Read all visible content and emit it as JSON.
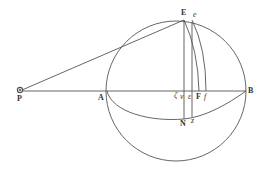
{
  "figure": {
    "type": "geometric-diagram",
    "stroke_color": "#555555",
    "background": "#ffffff",
    "circle": {
      "cx": 176,
      "cy": 91,
      "r": 70
    },
    "points": {
      "P": {
        "x": 20,
        "y": 91,
        "symbol": "sun"
      },
      "A": {
        "x": 107,
        "y": 91
      },
      "B": {
        "x": 246,
        "y": 91
      },
      "E": {
        "x": 184,
        "y": 20
      },
      "e": {
        "x": 192,
        "y": 20
      },
      "zeta": {
        "x": 183,
        "y": 91
      },
      "v": {
        "x": 184,
        "y": 91
      },
      "epsilon": {
        "x": 192,
        "y": 91
      },
      "F": {
        "x": 199,
        "y": 91
      },
      "f": {
        "x": 206,
        "y": 91
      },
      "N": {
        "x": 184,
        "y": 118
      },
      "z": {
        "x": 193,
        "y": 116
      }
    }
  },
  "labels": {
    "P": "P",
    "A": "A",
    "B": "B",
    "E": "E",
    "e": "e",
    "zeta": "ζ",
    "v": "v",
    "epsilon": "ε",
    "F": "F",
    "f": "f",
    "N": "N",
    "z": "z"
  }
}
